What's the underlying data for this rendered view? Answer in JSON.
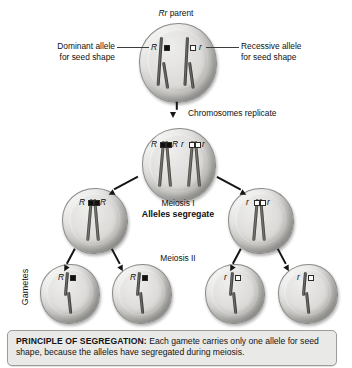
{
  "figure": {
    "parent_label_gene": "Rr",
    "parent_label_rest": " parent",
    "replicate_step": "Chromosomes replicate",
    "meiosis_one": "Meiosis I",
    "meiosis_one_sub": "Alleles segregate",
    "meiosis_two": "Meiosis II",
    "gametes_axis": "Gametes"
  },
  "callouts": {
    "dominant": {
      "line1": "Dominant allele",
      "line2": "for seed shape"
    },
    "recessive": {
      "line1": "Recessive allele",
      "line2": "for seed shape"
    }
  },
  "alleles": {
    "dominant_symbol": "R",
    "recessive_symbol": "r",
    "dominant_color": "#101010",
    "recessive_color": "#fbfbfa"
  },
  "cells": {
    "parent": {
      "left_allele": "R",
      "right_allele": "r"
    },
    "replicated": {
      "left_pair": [
        "R",
        "R"
      ],
      "right_pair": [
        "r",
        "r"
      ]
    },
    "meiosis1_left": {
      "left_allele": "R",
      "right_allele": "R"
    },
    "meiosis1_right": {
      "left_allele": "r",
      "right_allele": "r"
    },
    "gametes": [
      {
        "allele": "R"
      },
      {
        "allele": "R"
      },
      {
        "allele": "r"
      },
      {
        "allele": "r"
      }
    ]
  },
  "caption": {
    "heading": "PRINCIPLE OF SEGREGATION:",
    "body": " Each gamete carries only one allele for seed shape, because the alleles have segregated during meiosis."
  }
}
